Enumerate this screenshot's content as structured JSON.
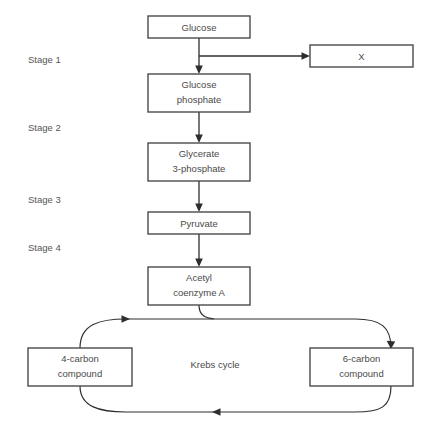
{
  "diagram": {
    "background_color": "#ffffff",
    "line_color": "#2e2e2e",
    "box_border_color": "#4a4a4a",
    "text_color": "#4a4a4a",
    "stages": [
      {
        "id": "stage-1",
        "label": "Stage 1"
      },
      {
        "id": "stage-2",
        "label": "Stage 2"
      },
      {
        "id": "stage-3",
        "label": "Stage 3"
      },
      {
        "id": "stage-4",
        "label": "Stage 4"
      }
    ],
    "boxes": [
      {
        "id": "glucose",
        "line1": "Glucose",
        "line2": ""
      },
      {
        "id": "product-x",
        "line1": "X",
        "line2": ""
      },
      {
        "id": "glucose-phosphate",
        "line1": "Glucose",
        "line2": "phosphate"
      },
      {
        "id": "glycerate-3-phosphate",
        "line1": "Glycerate",
        "line2": "3-phosphate"
      },
      {
        "id": "pyruvate",
        "line1": "Pyruvate",
        "line2": ""
      },
      {
        "id": "acetyl-coenzyme-a",
        "line1": "Acetyl",
        "line2": "coenzyme A"
      },
      {
        "id": "four-carbon-compound",
        "line1": "4-carbon",
        "line2": "compound"
      },
      {
        "id": "six-carbon-compound",
        "line1": "6-carbon",
        "line2": "compound"
      }
    ],
    "cycle": {
      "label": "Krebs cycle"
    }
  }
}
